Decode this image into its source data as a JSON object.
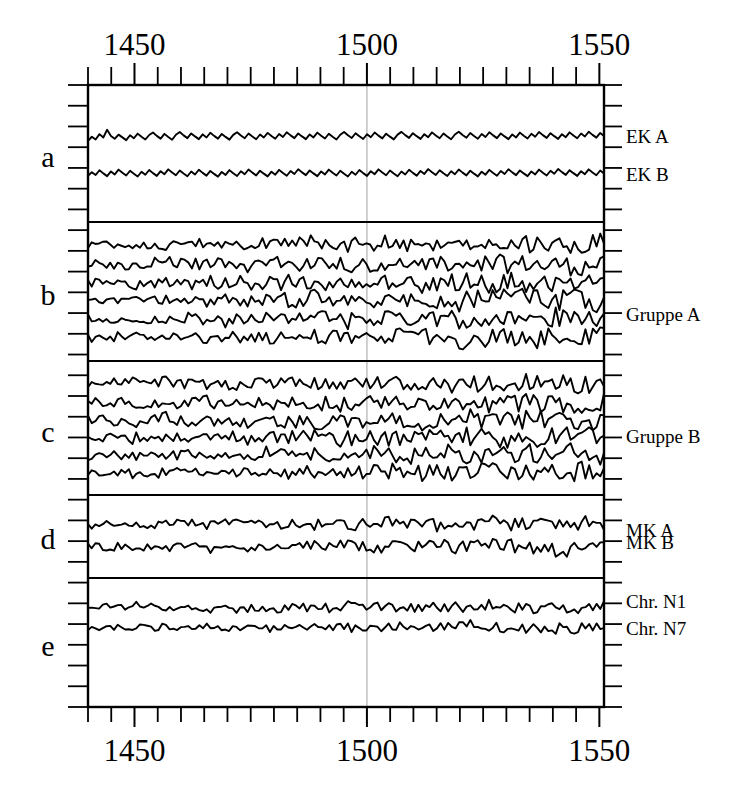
{
  "chart_data": {
    "type": "line",
    "title": "",
    "subtitle": "",
    "xlabel": "",
    "ylabel": "",
    "xlim": [
      1440,
      1551
    ],
    "grid": false,
    "legend_position": "right",
    "x_axis": {
      "tick_labels": [
        "1450",
        "1500",
        "1550"
      ],
      "tick_label_values": [
        1450,
        1500,
        1550
      ],
      "minor_tick_step": 5,
      "minor_tick_values": [
        1440,
        1445,
        1450,
        1455,
        1460,
        1465,
        1470,
        1475,
        1480,
        1485,
        1490,
        1495,
        1500,
        1505,
        1510,
        1515,
        1520,
        1525,
        1530,
        1535,
        1540,
        1545,
        1550
      ],
      "labels_on_top": true,
      "labels_on_bottom": true
    },
    "y_axis": {
      "tick_count": 30,
      "tick_labels": [],
      "ticks_on_left": true,
      "ticks_on_right": true
    },
    "annotations": [
      {
        "name": "gridline-1500",
        "x": 1500,
        "style": "thin-gray-vertical"
      }
    ],
    "panels": [
      {
        "letter": "a",
        "name": "panel-a",
        "series": [
          {
            "name": "EK A",
            "label": "EK A",
            "baseline": 0.62,
            "amplitude": 0.072,
            "seed": 11,
            "values": [
              0.601,
              0.634,
              0.612,
              0.655,
              0.628,
              0.69,
              0.64,
              0.618,
              0.651,
              0.629,
              0.607,
              0.646,
              0.622,
              0.659,
              0.634,
              0.612,
              0.648,
              0.668,
              0.641,
              0.619,
              0.657,
              0.632,
              0.61,
              0.65,
              0.672,
              0.645,
              0.623,
              0.661,
              0.637,
              0.615,
              0.653,
              0.628,
              0.666,
              0.641,
              0.619,
              0.657,
              0.633,
              0.611,
              0.649,
              0.67,
              0.644,
              0.622,
              0.66,
              0.636,
              0.614,
              0.652,
              0.628,
              0.665,
              0.64,
              0.618,
              0.656,
              0.632,
              0.67,
              0.645,
              0.623,
              0.661,
              0.637,
              0.615,
              0.653,
              0.629,
              0.667,
              0.642,
              0.62,
              0.658,
              0.634,
              0.612,
              0.65,
              0.672,
              0.646,
              0.624,
              0.662,
              0.638,
              0.616,
              0.654,
              0.63,
              0.668,
              0.643,
              0.621,
              0.659,
              0.635,
              0.613,
              0.651,
              0.673,
              0.647,
              0.625,
              0.663,
              0.639,
              0.617,
              0.655,
              0.631,
              0.669,
              0.644,
              0.622,
              0.66,
              0.636,
              0.614,
              0.652,
              0.674,
              0.648,
              0.626,
              0.664,
              0.64,
              0.618,
              0.656,
              0.632,
              0.67,
              0.645,
              0.623,
              0.661,
              0.637,
              0.615,
              0.653,
              0.629,
              0.667,
              0.642,
              0.62,
              0.658,
              0.634,
              0.672,
              0.647,
              0.625,
              0.663,
              0.639,
              0.617,
              0.655,
              0.631,
              0.669,
              0.644,
              0.622,
              0.66,
              0.636,
              0.674,
              0.649,
              0.627,
              0.665,
              0.641
            ]
          },
          {
            "name": "EK B",
            "label": "EK B",
            "baseline": 0.33,
            "amplitude": 0.068,
            "seed": 23,
            "values": [
              0.322,
              0.35,
              0.328,
              0.366,
              0.341,
              0.319,
              0.357,
              0.333,
              0.371,
              0.346,
              0.324,
              0.362,
              0.338,
              0.316,
              0.354,
              0.33,
              0.368,
              0.343,
              0.321,
              0.359,
              0.335,
              0.373,
              0.348,
              0.326,
              0.364,
              0.34,
              0.318,
              0.356,
              0.332,
              0.37,
              0.345,
              0.323,
              0.361,
              0.337,
              0.315,
              0.353,
              0.329,
              0.367,
              0.342,
              0.32,
              0.358,
              0.334,
              0.372,
              0.347,
              0.325,
              0.363,
              0.339,
              0.317,
              0.355,
              0.331,
              0.369,
              0.344,
              0.322,
              0.36,
              0.336,
              0.374,
              0.349,
              0.327,
              0.365,
              0.341,
              0.319,
              0.357,
              0.333,
              0.371,
              0.346,
              0.324,
              0.362,
              0.338,
              0.316,
              0.354,
              0.33,
              0.368,
              0.343,
              0.321,
              0.359,
              0.335,
              0.373,
              0.348,
              0.326,
              0.364,
              0.34,
              0.318,
              0.356,
              0.332,
              0.37,
              0.345,
              0.323,
              0.361,
              0.337,
              0.375,
              0.35,
              0.328,
              0.366,
              0.342,
              0.32,
              0.358,
              0.334,
              0.372,
              0.347,
              0.325,
              0.363,
              0.339,
              0.317,
              0.355,
              0.331,
              0.369,
              0.344,
              0.322,
              0.36,
              0.336,
              0.374,
              0.349,
              0.327,
              0.365,
              0.341,
              0.319,
              0.357,
              0.333,
              0.371,
              0.346,
              0.324,
              0.362,
              0.338,
              0.376,
              0.351,
              0.329,
              0.367,
              0.343,
              0.321,
              0.359,
              0.335,
              0.373,
              0.348,
              0.326,
              0.364,
              0.34
            ]
          }
        ]
      },
      {
        "letter": "b",
        "name": "panel-b",
        "group_label": "Gruppe A",
        "series": [
          {
            "name": "Gruppe A trace 1",
            "label": "",
            "baseline": 0.87,
            "amplitude": 0.055,
            "seed": 31
          },
          {
            "name": "Gruppe A trace 2",
            "label": "",
            "baseline": 0.71,
            "amplitude": 0.06,
            "seed": 37
          },
          {
            "name": "Gruppe A trace 3",
            "label": "",
            "baseline": 0.57,
            "amplitude": 0.062,
            "seed": 41
          },
          {
            "name": "Gruppe A trace 4",
            "label": "",
            "baseline": 0.43,
            "amplitude": 0.064,
            "seed": 43
          },
          {
            "name": "Gruppe A trace 5",
            "label": "Gruppe A",
            "baseline": 0.28,
            "amplitude": 0.066,
            "seed": 47
          },
          {
            "name": "Gruppe A trace 6",
            "label": "",
            "baseline": 0.14,
            "amplitude": 0.062,
            "seed": 53
          }
        ]
      },
      {
        "letter": "c",
        "name": "panel-c",
        "group_label": "Gruppe B",
        "series": [
          {
            "name": "Gruppe B trace 1",
            "label": "",
            "baseline": 0.86,
            "amplitude": 0.058,
            "seed": 59
          },
          {
            "name": "Gruppe B trace 2",
            "label": "",
            "baseline": 0.7,
            "amplitude": 0.062,
            "seed": 61
          },
          {
            "name": "Gruppe B trace 3",
            "label": "",
            "baseline": 0.56,
            "amplitude": 0.066,
            "seed": 67
          },
          {
            "name": "Gruppe B trace 4",
            "label": "Gruppe B",
            "baseline": 0.42,
            "amplitude": 0.068,
            "seed": 71
          },
          {
            "name": "Gruppe B trace 5",
            "label": "",
            "baseline": 0.28,
            "amplitude": 0.064,
            "seed": 73
          },
          {
            "name": "Gruppe B trace 6",
            "label": "",
            "baseline": 0.14,
            "amplitude": 0.062,
            "seed": 79
          }
        ]
      },
      {
        "letter": "d",
        "name": "panel-d",
        "series": [
          {
            "name": "MK A",
            "label": "MK A",
            "baseline": 0.66,
            "amplitude": 0.09,
            "seed": 83
          },
          {
            "name": "MK B",
            "label": "MK B",
            "baseline": 0.36,
            "amplitude": 0.09,
            "seed": 89
          }
        ]
      },
      {
        "letter": "e",
        "name": "panel-e",
        "series": [
          {
            "name": "Chr. N1",
            "label": "Chr. N1",
            "baseline": 0.8,
            "amplitude": 0.042,
            "seed": 97
          },
          {
            "name": "Chr. N7",
            "label": "Chr. N7",
            "baseline": 0.63,
            "amplitude": 0.04,
            "seed": 101
          }
        ]
      }
    ],
    "colors": {
      "trace": "#000000",
      "frame": "#000000",
      "gridline": "#b0b0b0",
      "background": "#ffffff"
    }
  }
}
